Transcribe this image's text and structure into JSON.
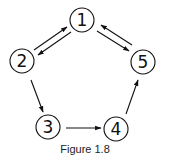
{
  "figure": {
    "caption": "Figure 1.8",
    "stroke_color": "#111111",
    "background": "#ffffff"
  },
  "nodes": [
    {
      "id": "1",
      "label": "1",
      "cx": 82,
      "cy": 20
    },
    {
      "id": "2",
      "label": "2",
      "cx": 22,
      "cy": 61
    },
    {
      "id": "3",
      "label": "3",
      "cx": 48,
      "cy": 127
    },
    {
      "id": "4",
      "label": "4",
      "cx": 116,
      "cy": 129
    },
    {
      "id": "5",
      "label": "5",
      "cx": 143,
      "cy": 62
    }
  ],
  "edges": [
    {
      "from": "2",
      "to": "1"
    },
    {
      "from": "1",
      "to": "2"
    },
    {
      "from": "1",
      "to": "5"
    },
    {
      "from": "5",
      "to": "1"
    },
    {
      "from": "2",
      "to": "3"
    },
    {
      "from": "3",
      "to": "4"
    },
    {
      "from": "4",
      "to": "5"
    }
  ]
}
